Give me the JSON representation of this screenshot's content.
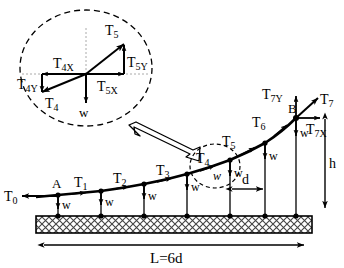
{
  "figure": {
    "title_visible": false,
    "type": "free-body-diagram-suspension-cable",
    "colors": {
      "stroke": "#000000",
      "hatch": "#555555",
      "background": "#ffffff"
    }
  },
  "detail_circle": {
    "name": "magnified-node-detail",
    "vectors": [
      {
        "id": "T5",
        "label": "T",
        "sub": "5",
        "dir": "up-right"
      },
      {
        "id": "T5Y",
        "label": "T",
        "sub": "5Y",
        "dir": "up"
      },
      {
        "id": "T5X",
        "label": "T",
        "sub": "5X",
        "dir": "right"
      },
      {
        "id": "T4",
        "label": "T",
        "sub": "4",
        "dir": "down-left"
      },
      {
        "id": "T4X",
        "label": "T",
        "sub": "4X",
        "dir": "left"
      },
      {
        "id": "T4Y",
        "label": "T",
        "sub": "4Y",
        "dir": "down"
      },
      {
        "id": "W",
        "label": "w",
        "sub": "",
        "dir": "down"
      }
    ]
  },
  "cable": {
    "nodes": [
      {
        "id": "A",
        "label": "A"
      },
      {
        "id": "B",
        "label": "B"
      }
    ],
    "tensions": [
      {
        "label": "T",
        "sub": "0"
      },
      {
        "label": "T",
        "sub": "1"
      },
      {
        "label": "T",
        "sub": "2"
      },
      {
        "label": "T",
        "sub": "3"
      },
      {
        "label": "T",
        "sub": "4"
      },
      {
        "label": "T",
        "sub": "5"
      },
      {
        "label": "T",
        "sub": "6"
      },
      {
        "label": "T",
        "sub": "7"
      }
    ],
    "end_components": [
      {
        "label": "T",
        "sub": "7Y",
        "dir": "up"
      },
      {
        "label": "T",
        "sub": "7X",
        "dir": "right"
      }
    ],
    "hanger_load_label": "w",
    "hanger_count": 7,
    "small_circle_label": "w"
  },
  "dimensions": {
    "span": {
      "label": "L=6d"
    },
    "pitch": {
      "label": "d"
    },
    "height": {
      "label": "h"
    }
  }
}
